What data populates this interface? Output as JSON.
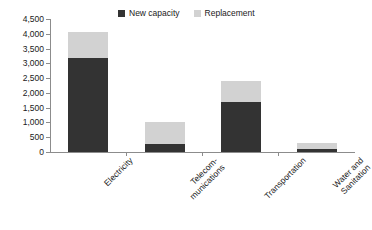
{
  "chart_data": {
    "type": "bar",
    "stacked": true,
    "title": "",
    "subtitle": "",
    "xlabel": "",
    "ylabel": "",
    "categories": [
      "Electricity",
      "Telecom-munications",
      "Transportation",
      "Water and Sanitation"
    ],
    "category_lines": [
      [
        "Electricity"
      ],
      [
        "Telecom-",
        "munications"
      ],
      [
        "Transportation"
      ],
      [
        "Water and",
        "Sanitation"
      ]
    ],
    "series": [
      {
        "name": "New capacity",
        "color": "#333333",
        "values": [
          3180,
          270,
          1690,
          100
        ]
      },
      {
        "name": "Replacement",
        "color": "#d2d2d2",
        "values": [
          880,
          745,
          710,
          200
        ]
      }
    ],
    "totals": [
      4060,
      1015,
      2400,
      300
    ],
    "ylim": [
      0,
      4500
    ],
    "ytick_values": [
      0,
      500,
      1000,
      1500,
      2000,
      2500,
      3000,
      3500,
      4000,
      4500
    ],
    "ytick_labels": [
      "0",
      "500",
      "1,000",
      "1,500",
      "2,000",
      "2,500",
      "3,000",
      "3,500",
      "4,000",
      "4,500"
    ],
    "grid": false,
    "legend_position": "top-center",
    "legend_entries": [
      {
        "label": "New capacity",
        "color": "#333333"
      },
      {
        "label": "Replacement",
        "color": "#d2d2d2"
      }
    ],
    "axis_color": "#8c8c8c",
    "background_color": "#ffffff"
  },
  "legend": {
    "entry0_label": "New capacity",
    "entry1_label": "Replacement"
  },
  "yaxis": {
    "l0": "0",
    "l1": "500",
    "l2": "1,000",
    "l3": "1,500",
    "l4": "2,000",
    "l5": "2,500",
    "l6": "3,000",
    "l7": "3,500",
    "l8": "4,000",
    "l9": "4,500"
  },
  "xaxis": {
    "c0_line0": "Electricity",
    "c1_line0": "Telecom-",
    "c1_line1": "munications",
    "c2_line0": "Transportation",
    "c3_line0": "Water and",
    "c3_line1": "Sanitation"
  }
}
